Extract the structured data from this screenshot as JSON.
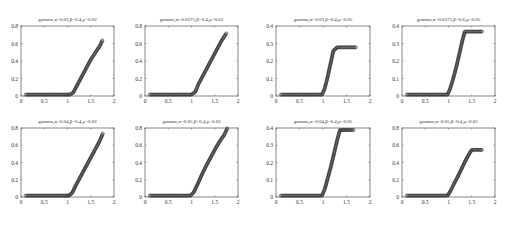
{
  "chart_data": [
    {
      "type": "scatter",
      "title": "gamma,α=0.03,β=0.4,μ=0.02",
      "xlabel": "",
      "ylabel": "",
      "xlim": [
        0,
        2
      ],
      "ylim": [
        0,
        0.8
      ],
      "xticks": [
        "0",
        "0.5",
        "1",
        "1.5",
        "2"
      ],
      "yticks": [
        "0",
        "0.2",
        "0.4",
        "0.6",
        "0.8"
      ],
      "marker": "open-circle",
      "grid": false,
      "x": [
        0.1,
        0.3,
        0.5,
        0.7,
        0.9,
        1.05,
        1.12,
        1.2,
        1.3,
        1.4,
        1.5,
        1.6,
        1.7,
        1.75
      ],
      "y": [
        0,
        0,
        0,
        0,
        0,
        0,
        0.02,
        0.1,
        0.2,
        0.3,
        0.4,
        0.48,
        0.56,
        0.62
      ],
      "frame": {
        "x0": 21,
        "x1": 114,
        "y0": 26,
        "y1": 96
      }
    },
    {
      "type": "scatter",
      "title": "gamma,α=0.0375,β=0.4,μ=0.02",
      "xlabel": "",
      "ylabel": "",
      "xlim": [
        0,
        2
      ],
      "ylim": [
        0,
        0.8
      ],
      "xticks": [
        "0",
        "0.5",
        "1",
        "1.5",
        "2"
      ],
      "yticks": [
        "0",
        "0.2",
        "0.4",
        "0.6",
        "0.8"
      ],
      "marker": "open-circle",
      "grid": false,
      "x": [
        0.1,
        0.3,
        0.5,
        0.7,
        0.9,
        1.0,
        1.08,
        1.15,
        1.25,
        1.35,
        1.45,
        1.55,
        1.65,
        1.75
      ],
      "y": [
        0,
        0,
        0,
        0,
        0,
        0,
        0.03,
        0.12,
        0.22,
        0.32,
        0.42,
        0.52,
        0.62,
        0.7
      ],
      "frame": {
        "x0": 145,
        "x1": 238,
        "y0": 26,
        "y1": 96
      }
    },
    {
      "type": "scatter",
      "title": "gamma,α=0.03,β=0.4,μ=0.05",
      "xlabel": "",
      "ylabel": "",
      "xlim": [
        0,
        2
      ],
      "ylim": [
        0,
        0.4
      ],
      "xticks": [
        "0",
        "0.5",
        "1",
        "1.5",
        "2"
      ],
      "yticks": [
        "0",
        "0.1",
        "0.2",
        "0.3",
        "0.4"
      ],
      "marker": "open-circle",
      "grid": false,
      "x": [
        0.1,
        0.3,
        0.5,
        0.7,
        0.9,
        0.98,
        1.03,
        1.08,
        1.13,
        1.18,
        1.22,
        1.3,
        1.4,
        1.5,
        1.6,
        1.7
      ],
      "y": [
        0,
        0,
        0,
        0,
        0,
        0,
        0.03,
        0.08,
        0.14,
        0.2,
        0.25,
        0.27,
        0.27,
        0.27,
        0.27,
        0.27
      ],
      "frame": {
        "x0": 276,
        "x1": 370,
        "y0": 26,
        "y1": 96
      }
    },
    {
      "type": "scatter",
      "title": "gamma,α=0.0375,β=0.6,μ=0.05",
      "xlabel": "",
      "ylabel": "",
      "xlim": [
        0,
        2
      ],
      "ylim": [
        0,
        0.4
      ],
      "xticks": [
        "0",
        "0.5",
        "1",
        "1.5",
        "2"
      ],
      "yticks": [
        "0",
        "0.1",
        "0.2",
        "0.3",
        "0.4"
      ],
      "marker": "open-circle",
      "grid": false,
      "x": [
        0.1,
        0.3,
        0.5,
        0.7,
        0.9,
        0.98,
        1.03,
        1.1,
        1.17,
        1.24,
        1.3,
        1.35,
        1.45,
        1.55,
        1.65,
        1.72
      ],
      "y": [
        0,
        0,
        0,
        0,
        0,
        0,
        0.03,
        0.09,
        0.16,
        0.24,
        0.31,
        0.36,
        0.36,
        0.36,
        0.36,
        0.36
      ],
      "frame": {
        "x0": 402,
        "x1": 495,
        "y0": 26,
        "y1": 96
      }
    },
    {
      "type": "scatter",
      "title": "gamma,α=0.04,β=0.4,μ=0.02",
      "xlabel": "",
      "ylabel": "",
      "xlim": [
        0,
        2
      ],
      "ylim": [
        0,
        0.8
      ],
      "xticks": [
        "0",
        "0.5",
        "1",
        "1.5",
        "2"
      ],
      "yticks": [
        "0",
        "0.2",
        "0.4",
        "0.6",
        "0.8"
      ],
      "marker": "open-circle",
      "grid": false,
      "x": [
        0.1,
        0.3,
        0.5,
        0.7,
        0.9,
        1.03,
        1.1,
        1.18,
        1.28,
        1.38,
        1.48,
        1.58,
        1.68,
        1.76
      ],
      "y": [
        0,
        0,
        0,
        0,
        0,
        0,
        0.03,
        0.12,
        0.22,
        0.32,
        0.42,
        0.52,
        0.62,
        0.72
      ],
      "frame": {
        "x0": 21,
        "x1": 114,
        "y0": 128,
        "y1": 197
      }
    },
    {
      "type": "scatter",
      "title": "gamma,α=0.05,β=0.4,μ=0.02",
      "xlabel": "",
      "ylabel": "",
      "xlim": [
        0,
        2
      ],
      "ylim": [
        0,
        0.8
      ],
      "xticks": [
        "0",
        "0.5",
        "1",
        "1.5",
        "2"
      ],
      "yticks": [
        "0",
        "0.2",
        "0.4",
        "0.6",
        "0.8"
      ],
      "marker": "open-circle",
      "grid": false,
      "x": [
        0.1,
        0.3,
        0.5,
        0.7,
        0.9,
        0.98,
        1.05,
        1.13,
        1.22,
        1.32,
        1.42,
        1.52,
        1.62,
        1.7,
        1.77
      ],
      "y": [
        0,
        0,
        0,
        0,
        0,
        0,
        0.04,
        0.13,
        0.24,
        0.35,
        0.45,
        0.55,
        0.64,
        0.7,
        0.78
      ],
      "frame": {
        "x0": 145,
        "x1": 238,
        "y0": 128,
        "y1": 197
      }
    },
    {
      "type": "scatter",
      "title": "gamma,α=0.04,β=0.4,μ=0.05",
      "xlabel": "",
      "ylabel": "",
      "xlim": [
        0,
        2
      ],
      "ylim": [
        0,
        0.4
      ],
      "xticks": [
        "0",
        "0.5",
        "1",
        "1.5",
        "2"
      ],
      "yticks": [
        "0",
        "0.1",
        "0.2",
        "0.3",
        "0.4"
      ],
      "marker": "open-circle",
      "grid": false,
      "x": [
        0.1,
        0.3,
        0.5,
        0.7,
        0.9,
        0.98,
        1.04,
        1.1,
        1.17,
        1.24,
        1.3,
        1.36,
        1.45,
        1.55,
        1.65
      ],
      "y": [
        0,
        0,
        0,
        0,
        0,
        0,
        0.04,
        0.1,
        0.17,
        0.25,
        0.32,
        0.38,
        0.38,
        0.38,
        0.38
      ],
      "frame": {
        "x0": 276,
        "x1": 370,
        "y0": 128,
        "y1": 197
      }
    },
    {
      "type": "scatter",
      "title": "gamma,α=0.05,β=0.4,μ=0.05",
      "xlabel": "",
      "ylabel": "",
      "xlim": [
        0,
        2
      ],
      "ylim": [
        0,
        0.8
      ],
      "xticks": [
        "0",
        "0.5",
        "1",
        "1.5",
        "2"
      ],
      "yticks": [
        "0",
        "0.2",
        "0.4",
        "0.6",
        "0.8"
      ],
      "marker": "open-circle",
      "grid": false,
      "x": [
        0.1,
        0.3,
        0.5,
        0.7,
        0.9,
        0.98,
        1.05,
        1.12,
        1.2,
        1.28,
        1.36,
        1.44,
        1.5,
        1.58,
        1.66,
        1.72
      ],
      "y": [
        0,
        0,
        0,
        0,
        0,
        0,
        0.06,
        0.14,
        0.22,
        0.31,
        0.4,
        0.48,
        0.53,
        0.53,
        0.53,
        0.53
      ],
      "frame": {
        "x0": 402,
        "x1": 495,
        "y0": 128,
        "y1": 197
      }
    }
  ]
}
